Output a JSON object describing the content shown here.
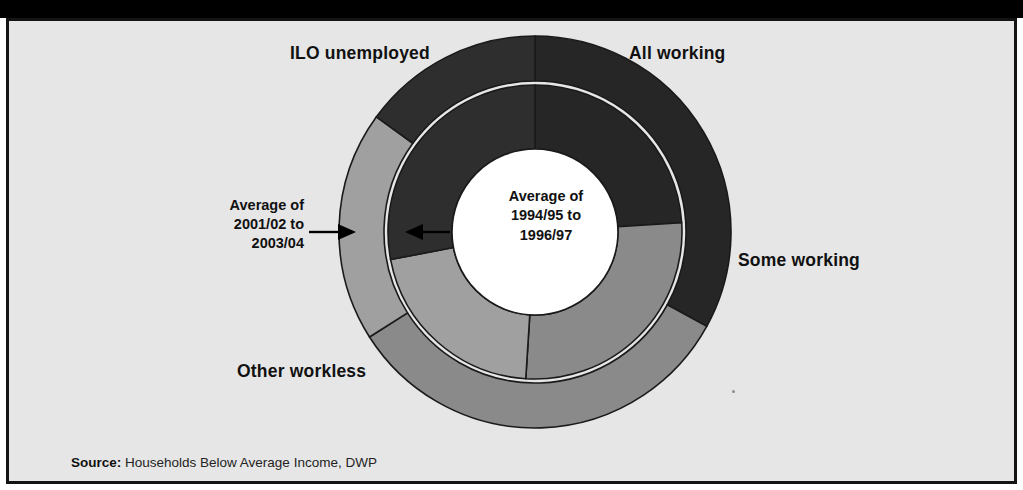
{
  "figure": {
    "background_color": "#e6e6e6",
    "frame_color": "#141414",
    "top_band_color": "#000000"
  },
  "source": {
    "key": "Source:",
    "text": " Households Below Average Income, DWP"
  },
  "callouts": {
    "outer": {
      "line1": "Average of",
      "line2": "2001/02 to",
      "line3": "2003/04",
      "arrow_direction": "right",
      "points_to": "outer-ring"
    },
    "inner": {
      "line1": "Average of",
      "line2": "1994/95 to",
      "line3": "1996/97",
      "arrow_direction": "left",
      "points_to": "inner-ring"
    }
  },
  "category_labels": [
    {
      "name": "all-working",
      "text": "All working"
    },
    {
      "name": "ilo-unemployed",
      "text": "ILO unemployed"
    },
    {
      "name": "some-working",
      "text": "Some working"
    },
    {
      "name": "other-workless",
      "text": "Other workless"
    }
  ],
  "chart_data": {
    "type": "pie",
    "title": "",
    "subtype": "nested-donut",
    "legend_position": "around-chart",
    "grid": false,
    "categories": [
      "All working",
      "Some working",
      "Other workless",
      "ILO unemployed"
    ],
    "colors": {
      "All working": "#262626",
      "Some working": "#8a8a8a",
      "Other workless": "#a0a0a0",
      "ILO unemployed": "#2e2e2e"
    },
    "rings": [
      {
        "name": "Average of 1994/95 to 1996/97",
        "ring": "inner",
        "values": [
          24,
          27,
          21,
          28
        ],
        "start_angle_deg": 0,
        "direction": "clockwise"
      },
      {
        "name": "Average of 2001/02 to 2003/04",
        "ring": "outer",
        "values": [
          33,
          33,
          19,
          15
        ],
        "start_angle_deg": 0,
        "direction": "clockwise"
      }
    ]
  },
  "geometry": {
    "center_x": 526,
    "center_y": 211,
    "outer_radius": 196,
    "ring_gap_radius": 147,
    "hub_radius": 83
  }
}
